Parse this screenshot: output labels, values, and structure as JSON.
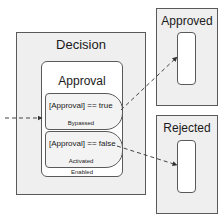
{
  "diagram": {
    "type": "state-machine",
    "incoming_arrow": {
      "style": "dashed",
      "target": "Decision"
    },
    "states": {
      "decision": {
        "title": "Decision"
      },
      "approval": {
        "title": "Approval",
        "footer": "Enabled",
        "transitions": [
          {
            "condition": "[Approval] == true",
            "status": "Bypassed",
            "target": "Approved"
          },
          {
            "condition": "[Approval] == false",
            "status": "Activated",
            "target": "Rejected"
          }
        ]
      },
      "approved": {
        "title": "Approved"
      },
      "rejected": {
        "title": "Rejected"
      }
    },
    "colors": {
      "outline": "#5a5a5a",
      "state_fill": "#efefef",
      "inner_fill": "#ffffff",
      "arrow": "#444444"
    }
  }
}
